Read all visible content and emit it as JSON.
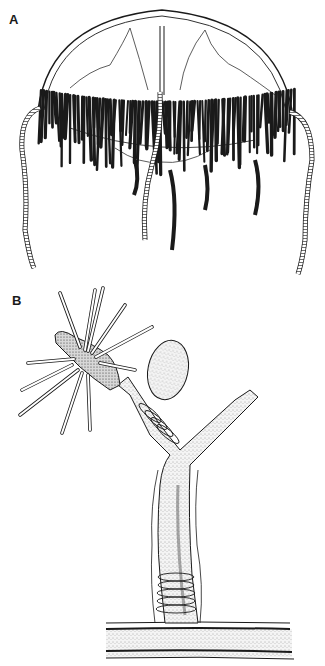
{
  "figure": {
    "panels": [
      {
        "label": "A",
        "subject": "medusa"
      },
      {
        "label": "B",
        "subject": "hydroid-polyp"
      }
    ]
  },
  "colors": {
    "ink": "#1a1a1a",
    "background": "#ffffff",
    "stipple": "#555555"
  }
}
